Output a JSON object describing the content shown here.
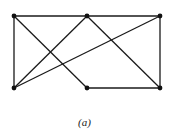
{
  "figure": {
    "caption": "(a)",
    "colors": {
      "edge": "#1a1a1a",
      "vertex": "#111111",
      "background": "#ffffff"
    },
    "vertices": [
      {
        "id": "TL",
        "x": 14,
        "y": 16
      },
      {
        "id": "TM",
        "x": 87,
        "y": 16
      },
      {
        "id": "TR",
        "x": 160,
        "y": 16
      },
      {
        "id": "BL",
        "x": 14,
        "y": 88
      },
      {
        "id": "BM",
        "x": 87,
        "y": 88
      },
      {
        "id": "BR",
        "x": 160,
        "y": 88
      }
    ],
    "edges": [
      [
        "TL",
        "TM"
      ],
      [
        "TM",
        "TR"
      ],
      [
        "TL",
        "BL"
      ],
      [
        "TR",
        "BR"
      ],
      [
        "BM",
        "BR"
      ],
      [
        "TL",
        "BM"
      ],
      [
        "TM",
        "BL"
      ],
      [
        "TR",
        "BL"
      ],
      [
        "TM",
        "BR"
      ]
    ]
  }
}
